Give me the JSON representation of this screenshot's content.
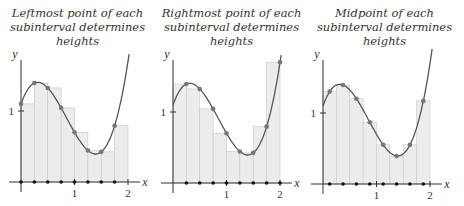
{
  "chart_data": [
    {
      "type": "area",
      "title": "Leftmost point of each subinterval determines heights",
      "title_lines": [
        "Leftmost point of each",
        "subinterval determines heights"
      ],
      "xlabel": "x",
      "ylabel": "y",
      "x_ticks": [
        "1",
        "2"
      ],
      "y_ticks": [
        "1"
      ],
      "xlim": [
        0,
        2
      ],
      "ylim": [
        0,
        2.2
      ],
      "rule": "left",
      "n_subintervals": 8,
      "sample_x": [
        0,
        0.25,
        0.5,
        0.75,
        1.0,
        1.25,
        1.5,
        1.75
      ],
      "heights": [
        1.1,
        1.38,
        1.33,
        1.08,
        0.7,
        0.43,
        0.43,
        0.74
      ],
      "function_samples": {
        "x": [
          0,
          0.25,
          0.5,
          0.75,
          1,
          1.25,
          1.5,
          1.75,
          2
        ],
        "y": [
          1.1,
          1.38,
          1.33,
          1.08,
          0.7,
          0.43,
          0.43,
          0.74,
          1.7
        ]
      }
    },
    {
      "type": "area",
      "title": "Rightmost point of each subinterval determines heights",
      "title_lines": [
        "Rightmost point of each",
        "subinterval determines heights"
      ],
      "xlabel": "x",
      "ylabel": "y",
      "x_ticks": [
        "1",
        "2"
      ],
      "y_ticks": [
        "1"
      ],
      "xlim": [
        0,
        2
      ],
      "ylim": [
        0,
        2.2
      ],
      "rule": "right",
      "n_subintervals": 8,
      "sample_x": [
        0.25,
        0.5,
        0.75,
        1.0,
        1.25,
        1.5,
        1.75,
        2.0
      ],
      "heights": [
        1.38,
        1.33,
        1.08,
        0.7,
        0.43,
        0.43,
        0.74,
        1.7
      ],
      "function_samples": {
        "x": [
          0,
          0.25,
          0.5,
          0.75,
          1,
          1.25,
          1.5,
          1.75,
          2
        ],
        "y": [
          1.1,
          1.38,
          1.33,
          1.08,
          0.7,
          0.43,
          0.43,
          0.74,
          1.7
        ]
      }
    },
    {
      "type": "area",
      "title": "Midpoint of each subinterval determines heights",
      "title_lines": [
        "Midpoint of each",
        "subinterval determines heights"
      ],
      "xlabel": "x",
      "ylabel": "y",
      "x_ticks": [
        "1",
        "2"
      ],
      "y_ticks": [
        "1"
      ],
      "xlim": [
        0,
        2
      ],
      "ylim": [
        0,
        2.2
      ],
      "rule": "mid",
      "n_subintervals": 8,
      "sample_x": [
        0.125,
        0.375,
        0.625,
        0.875,
        1.125,
        1.375,
        1.625,
        1.875
      ],
      "heights": [
        1.3,
        1.39,
        1.22,
        0.9,
        0.55,
        0.4,
        0.55,
        1.12
      ],
      "function_samples": {
        "x": [
          0,
          0.25,
          0.5,
          0.75,
          1,
          1.25,
          1.5,
          1.75,
          2
        ],
        "y": [
          1.1,
          1.38,
          1.33,
          1.08,
          0.7,
          0.43,
          0.43,
          0.74,
          1.7
        ]
      }
    }
  ],
  "panels": [
    {
      "title_line1": "Leftmost point of each",
      "title_line2": "subinterval determines heights",
      "origin_x": 21,
      "axis_y": 182
    },
    {
      "title_line1": "Rightmost point of each",
      "title_line2": "subinterval determines heights",
      "origin_x": 19,
      "axis_y": 183
    },
    {
      "title_line1": "Midpoint of each",
      "title_line2": "subinterval determines heights",
      "origin_x": 18,
      "axis_y": 184
    }
  ],
  "style": {
    "fill": "#ececec",
    "bar_stroke": "#c8c8c8",
    "curve": "#555555",
    "curve_dot": "#777777",
    "axis": "#333333",
    "axis_dot": "#111111",
    "x_scale": 53.5,
    "y_scale": 71
  }
}
